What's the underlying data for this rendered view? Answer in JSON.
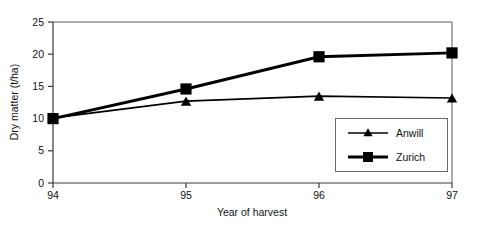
{
  "chart_data": {
    "type": "line",
    "title": "",
    "xlabel": "Year of harvest",
    "ylabel": "Dry matter (t/ha)",
    "categories": [
      "94",
      "95",
      "96",
      "97"
    ],
    "x": [
      94,
      95,
      96,
      97
    ],
    "xlim": [
      94,
      97
    ],
    "ylim": [
      0,
      25
    ],
    "yticks": [
      0,
      5,
      10,
      15,
      20,
      25
    ],
    "ytick_labels": [
      "0",
      "5",
      "10",
      "15",
      "20",
      "25"
    ],
    "xticks": [
      94,
      95,
      96,
      97
    ],
    "xtick_labels": [
      "94",
      "95",
      "96",
      "97"
    ],
    "grid": false,
    "legend_position": "lower right inside plot",
    "series": [
      {
        "name": "Anwill",
        "marker": "triangle",
        "color": "#000000",
        "line_width": "thin",
        "values": [
          10.1,
          12.7,
          13.5,
          13.2
        ]
      },
      {
        "name": "Zurich",
        "marker": "square",
        "color": "#000000",
        "line_width": "thick",
        "values": [
          10.0,
          14.6,
          19.6,
          20.2
        ]
      }
    ]
  },
  "axes": {
    "y_title": "Dry matter (t/ha)",
    "x_title": "Year of harvest",
    "y_tick_0": "0",
    "y_tick_1": "5",
    "y_tick_2": "10",
    "y_tick_3": "15",
    "y_tick_4": "20",
    "y_tick_5": "25",
    "x_tick_0": "94",
    "x_tick_1": "95",
    "x_tick_2": "96",
    "x_tick_3": "97"
  },
  "legend": {
    "entry_0_label": "Anwill",
    "entry_1_label": "Zurich"
  },
  "colors": {
    "series": "#000000",
    "frame": "#5a5a5a",
    "axis": "#3a3a3a",
    "background": "#ffffff",
    "text": "#111111"
  }
}
